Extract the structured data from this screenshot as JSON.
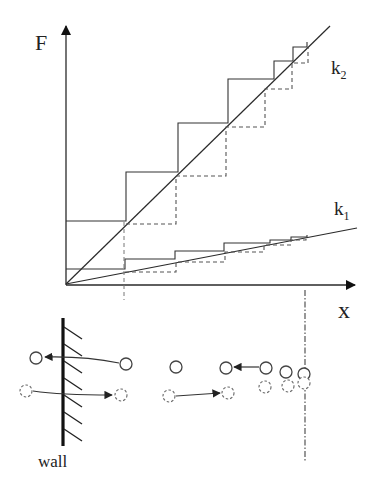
{
  "diagram": {
    "type": "force-displacement staircase with particle-wall schematic",
    "axes": {
      "y_label": "F",
      "x_label": "x"
    },
    "lines": [
      {
        "id": "k2",
        "label": "k",
        "subscript": "2",
        "description": "steep stiffness line"
      },
      {
        "id": "k1",
        "label": "k",
        "subscript": "1",
        "description": "shallow stiffness line"
      }
    ],
    "staircases": {
      "k2_solid_steps": 5,
      "k2_dashed_steps": 5,
      "k1_solid_steps": 6,
      "k1_dashed_steps": 6
    },
    "wall_label": "wall",
    "particles": {
      "solid_row_count": 7,
      "dashed_row_count": 7,
      "arrows": [
        {
          "row": "solid",
          "direction": "left",
          "from": "particle right of wall",
          "to": "particle left of wall"
        },
        {
          "row": "dashed",
          "direction": "right",
          "from": "particle left of wall",
          "to": "particle right of wall"
        },
        {
          "row": "solid",
          "direction": "left",
          "from": "particle 4",
          "to": "particle 3"
        },
        {
          "row": "dashed",
          "direction": "right",
          "from": "particle 2",
          "to": "particle 3"
        }
      ]
    },
    "colors": {
      "ink": "#2a2a2a",
      "background": "#ffffff"
    }
  }
}
